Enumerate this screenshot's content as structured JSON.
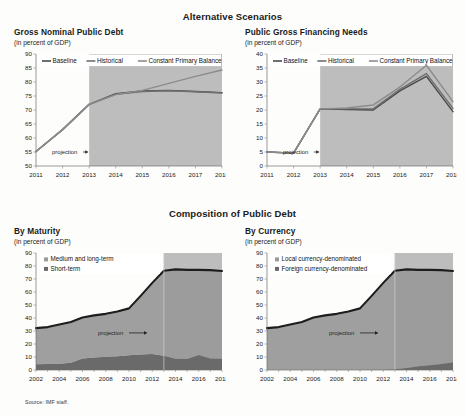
{
  "document": {
    "source_note": "Source: IMF staff."
  },
  "sections": [
    {
      "id": "alternative-scenarios",
      "title": "Alternative Scenarios"
    },
    {
      "id": "composition-of-public-debt",
      "title": "Composition of Public Debt"
    }
  ],
  "panels": {
    "gross_nominal_public_debt": {
      "title": "Gross Nominal Public Debt",
      "unit": "(in percent of GDP)",
      "projection_label": "projection"
    },
    "public_gross_financing_needs": {
      "title": "Public Gross Financing Needs",
      "unit": "(in percent of GDP)",
      "projection_label": "projection"
    },
    "by_maturity": {
      "title": "By Maturity",
      "unit": "(in percent of GDP)",
      "projection_label": "projection"
    },
    "by_currency": {
      "title": "By Currency",
      "unit": "(in percent of GDP)",
      "projection_label": "projection"
    }
  },
  "colors": {
    "baseline": "#4a4a4a",
    "historical": "#6e6e6e",
    "constant_primary_balance": "#8c8c8c",
    "projection_shade": "#b9b9b9",
    "medium_long_term": "#9a9a9a",
    "short_term": "#6a6a6a",
    "local_currency": "#9a9a9a",
    "foreign_currency": "#6a6a6a",
    "axis": "#6f6f6f",
    "text": "#1a1a1a"
  },
  "chart_data": [
    {
      "id": "gross-nominal-public-debt",
      "type": "line",
      "title": "Gross Nominal Public Debt",
      "xlabel": "",
      "ylabel": "",
      "unit": "(in percent of GDP)",
      "x": [
        2011,
        2012,
        2013,
        2014,
        2015,
        2016,
        2017,
        2018
      ],
      "xticklabels": [
        "2011",
        "2012",
        "2013",
        "2014",
        "2015",
        "2016",
        "2017",
        "2018"
      ],
      "ylim": [
        50,
        90
      ],
      "yticks": [
        50,
        55,
        60,
        65,
        70,
        75,
        80,
        85,
        90
      ],
      "grid": false,
      "legend_position": "top",
      "projection_start": 2013,
      "annotations": [
        "projection"
      ],
      "series": [
        {
          "name": "Baseline",
          "values": [
            55.2,
            63.0,
            72.0,
            75.8,
            76.8,
            77.0,
            76.6,
            76.2
          ]
        },
        {
          "name": "Historical",
          "values": [
            55.2,
            63.0,
            72.0,
            75.6,
            76.6,
            76.9,
            76.5,
            76.1
          ]
        },
        {
          "name": "Constant Primary Balance",
          "values": [
            55.2,
            63.0,
            72.0,
            75.5,
            77.0,
            79.5,
            82.0,
            84.3
          ]
        }
      ]
    },
    {
      "id": "public-gross-financing-needs",
      "type": "line",
      "title": "Public Gross Financing Needs",
      "xlabel": "",
      "ylabel": "",
      "unit": "(in percent of GDP)",
      "x": [
        2011,
        2012,
        2013,
        2014,
        2015,
        2016,
        2017,
        2018
      ],
      "xticklabels": [
        "2011",
        "2012",
        "2013",
        "2014",
        "2015",
        "2016",
        "2017",
        "2018"
      ],
      "ylim": [
        0,
        40
      ],
      "yticks": [
        0,
        5,
        10,
        15,
        20,
        25,
        30,
        35,
        40
      ],
      "grid": false,
      "legend_position": "top",
      "projection_start": 2013,
      "annotations": [
        "projection"
      ],
      "series": [
        {
          "name": "Baseline",
          "values": [
            5.0,
            4.6,
            20.4,
            20.2,
            20.0,
            26.8,
            32.0,
            19.4
          ]
        },
        {
          "name": "Historical",
          "values": [
            5.0,
            4.6,
            20.4,
            20.4,
            20.4,
            27.4,
            33.0,
            20.6
          ]
        },
        {
          "name": "Constant Primary Balance",
          "values": [
            5.0,
            4.6,
            20.4,
            20.7,
            21.8,
            28.2,
            36.0,
            23.0
          ]
        }
      ]
    },
    {
      "id": "by-maturity",
      "type": "area",
      "title": "By Maturity",
      "xlabel": "",
      "ylabel": "",
      "unit": "(in percent of GDP)",
      "x": [
        2002,
        2003,
        2004,
        2005,
        2006,
        2007,
        2008,
        2009,
        2010,
        2011,
        2012,
        2013,
        2014,
        2015,
        2016,
        2017,
        2018
      ],
      "xticklabels": [
        "2002",
        "2004",
        "2006",
        "2008",
        "2010",
        "2012",
        "2014",
        "2016",
        "2018"
      ],
      "ylim": [
        0,
        90
      ],
      "yticks": [
        0,
        10,
        20,
        30,
        40,
        50,
        60,
        70,
        80,
        90
      ],
      "grid": false,
      "legend_position": "top-left",
      "projection_start": 2013,
      "annotations": [
        "projection"
      ],
      "stacked": true,
      "series": [
        {
          "name": "Short-term",
          "values": [
            4.5,
            4.6,
            4.8,
            5.6,
            8.8,
            9.6,
            10.2,
            10.6,
            11.4,
            12.0,
            12.4,
            11.0,
            8.6,
            8.4,
            11.6,
            8.8,
            8.6
          ]
        },
        {
          "name": "Medium and long-term",
          "values": [
            27.7,
            28.4,
            30.2,
            31.4,
            31.6,
            32.4,
            33.0,
            34.4,
            36.0,
            45.0,
            54.6,
            65.4,
            68.8,
            68.6,
            65.4,
            68.0,
            67.6
          ]
        }
      ],
      "totals": [
        32.2,
        33.0,
        35.0,
        37.0,
        40.4,
        42.0,
        43.2,
        45.0,
        47.4,
        57.0,
        67.0,
        76.4,
        77.4,
        77.0,
        77.0,
        76.8,
        76.2
      ]
    },
    {
      "id": "by-currency",
      "type": "area",
      "title": "By Currency",
      "xlabel": "",
      "ylabel": "",
      "unit": "(in percent of GDP)",
      "x": [
        2002,
        2003,
        2004,
        2005,
        2006,
        2007,
        2008,
        2009,
        2010,
        2011,
        2012,
        2013,
        2014,
        2015,
        2016,
        2017,
        2018
      ],
      "xticklabels": [
        "2002",
        "2004",
        "2006",
        "2008",
        "2010",
        "2012",
        "2014",
        "2016",
        "2018"
      ],
      "ylim": [
        0,
        90
      ],
      "yticks": [
        0,
        10,
        20,
        30,
        40,
        50,
        60,
        70,
        80,
        90
      ],
      "grid": false,
      "legend_position": "top-left",
      "projection_start": 2013,
      "annotations": [
        "projection"
      ],
      "stacked": true,
      "series": [
        {
          "name": "Foreign currency-denominated",
          "values": [
            0.2,
            0.2,
            0.2,
            0.2,
            0.2,
            0.2,
            0.2,
            0.2,
            0.2,
            0.3,
            0.4,
            0.6,
            1.6,
            2.8,
            3.6,
            4.6,
            6.0
          ]
        },
        {
          "name": "Local currency-denominated",
          "values": [
            32.0,
            32.8,
            34.8,
            36.8,
            40.2,
            41.8,
            43.0,
            44.8,
            47.2,
            56.7,
            66.6,
            75.8,
            75.8,
            74.2,
            73.4,
            72.2,
            70.2
          ]
        }
      ],
      "totals": [
        32.2,
        33.0,
        35.0,
        37.0,
        40.4,
        42.0,
        43.2,
        45.0,
        47.4,
        57.0,
        67.0,
        76.4,
        77.4,
        77.0,
        77.0,
        76.8,
        76.2
      ]
    }
  ],
  "legends": {
    "scenarios": [
      "Baseline",
      "Historical",
      "Constant Primary Balance"
    ],
    "maturity": [
      "Medium and long-term",
      "Short-term"
    ],
    "currency": [
      "Local currency-denominated",
      "Foreign currency-denominated"
    ]
  }
}
